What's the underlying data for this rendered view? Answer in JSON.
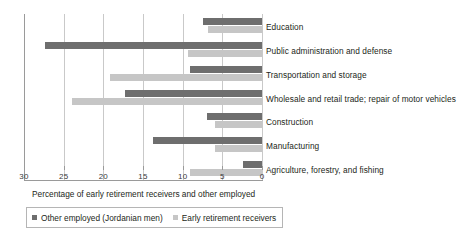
{
  "chart_data": {
    "type": "bar",
    "orientation": "horizontal",
    "title": "",
    "xlabel": "Percentage of early retirement receivers and other employed",
    "ylabel": "",
    "xlim": [
      30,
      0
    ],
    "x_axis_reversed": true,
    "xticks": [
      30,
      25,
      20,
      15,
      10,
      5,
      0
    ],
    "xtick_labels": [
      "30",
      "25",
      "20",
      "15",
      "10",
      "5",
      "0"
    ],
    "grid": true,
    "grid_axis": "x",
    "legend_position": "bottom-left",
    "categories": [
      "Education",
      "Public administration and defense",
      "Transportation and storage",
      "Wholesale and retail trade; repair of motor vehicles",
      "Construction",
      "Manufacturing",
      "Agriculture, forestry, and fishing"
    ],
    "series": [
      {
        "name": "Other employed (Jordanian men)",
        "color": "#6e6e6e",
        "values": [
          7.4,
          27.4,
          9.1,
          17.3,
          7.0,
          13.7,
          2.4
        ]
      },
      {
        "name": "Early retirement receivers",
        "color": "#c6c6c6",
        "values": [
          6.8,
          9.3,
          19.2,
          24.0,
          5.9,
          5.9,
          9.1
        ]
      }
    ]
  },
  "axis": {
    "title": "Percentage of early retirement receivers and other employed",
    "ticks": [
      "30",
      "25",
      "20",
      "15",
      "10",
      "5",
      "0"
    ]
  },
  "legend": {
    "items": [
      {
        "label": "Other employed (Jordanian men)",
        "swatch": "dark"
      },
      {
        "label": "Early retirement receivers",
        "swatch": "light"
      }
    ]
  },
  "colors": {
    "dark_series": "#6e6e6e",
    "light_series": "#c6c6c6",
    "axis": "#9a9a9a",
    "grid": "#c9c9c9",
    "text": "#231f20"
  }
}
